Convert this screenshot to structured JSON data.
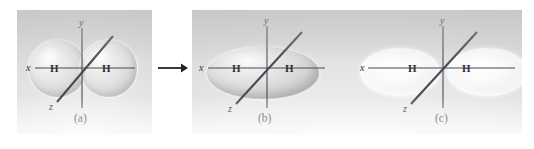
{
  "figure": {
    "background_color": "#ffffff",
    "panel_color": "#e3e3e3",
    "line_color": "#4a4a52",
    "text_color": "#2f2f35"
  },
  "operators": {
    "arrow": "reaction-arrow",
    "arrow_glyph": "→",
    "plus": "+"
  },
  "panels": [
    {
      "id": "a",
      "caption": "(a)",
      "description": "Two overlapping hydrogen 1s atomic orbitals",
      "orbital_type": "atomic-1s-pair",
      "lobe_count": 2,
      "lobe_shade": "grey-translucent",
      "axes": [
        {
          "name": "x",
          "label": "x"
        },
        {
          "name": "y",
          "label": "y"
        },
        {
          "name": "z",
          "label": "z"
        }
      ],
      "atoms": [
        {
          "label": "H",
          "position": "left"
        },
        {
          "label": "H",
          "position": "right"
        }
      ]
    },
    {
      "id": "b",
      "caption": "(b)",
      "description": "Bonding sigma molecular orbital, single merged ellipsoid",
      "orbital_type": "sigma-bonding",
      "lobe_count": 1,
      "lobe_shade": "grey-translucent",
      "axes": [
        {
          "name": "x",
          "label": "x"
        },
        {
          "name": "y",
          "label": "y"
        },
        {
          "name": "z",
          "label": "z"
        }
      ],
      "atoms": [
        {
          "label": "H",
          "position": "left"
        },
        {
          "label": "H",
          "position": "right"
        }
      ]
    },
    {
      "id": "c",
      "caption": "(c)",
      "description": "Antibonding sigma-star molecular orbital, two separated pale lobes",
      "orbital_type": "sigma-antibonding",
      "lobe_count": 2,
      "lobe_shade": "white-pale",
      "axes": [
        {
          "name": "x",
          "label": "x"
        },
        {
          "name": "y",
          "label": "y"
        },
        {
          "name": "z",
          "label": "z"
        }
      ],
      "atoms": [
        {
          "label": "H",
          "position": "left"
        },
        {
          "label": "H",
          "position": "right"
        }
      ]
    }
  ]
}
